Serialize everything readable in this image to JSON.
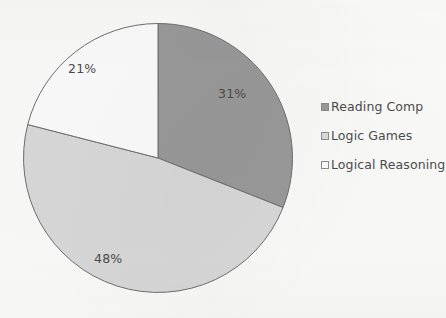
{
  "chart_data": {
    "type": "pie",
    "title": "",
    "categories": [
      "Reading Comp",
      "Logic Games",
      "Logical Reasoning"
    ],
    "values": [
      31,
      48,
      21
    ],
    "value_unit": "percent",
    "data_labels": [
      "31%",
      "48%",
      "21%"
    ],
    "colors": [
      "#9a9a9a",
      "#d9d9d9",
      "#fcfcfc"
    ],
    "slice_outline_color": "#6f6f6f",
    "start_angle_deg": 0,
    "direction": "clockwise",
    "legend_position": "right",
    "grid": false,
    "xlabel": "",
    "ylabel": ""
  },
  "chart": {
    "slices": [
      {
        "key": "reading-comp",
        "label": "Reading Comp",
        "data_label": "31%",
        "value": 31,
        "color": "#9a9a9a"
      },
      {
        "key": "logic-games",
        "label": "Logic Games",
        "data_label": "48%",
        "value": 48,
        "color": "#d9d9d9"
      },
      {
        "key": "logical-reasoning",
        "label": "Logical Reasoning",
        "data_label": "21%",
        "value": 21,
        "color": "#fcfcfc"
      }
    ]
  },
  "legend": {
    "items": [
      {
        "label": "Reading Comp",
        "color": "#9a9a9a"
      },
      {
        "label": "Logic Games",
        "color": "#dcdcdc"
      },
      {
        "label": "Logical Reasoning",
        "color": "#fdfdfd"
      }
    ]
  },
  "colors": {
    "background": "#fbfbfa",
    "text": "#4b4b4b",
    "outline": "#6f6f6f"
  }
}
